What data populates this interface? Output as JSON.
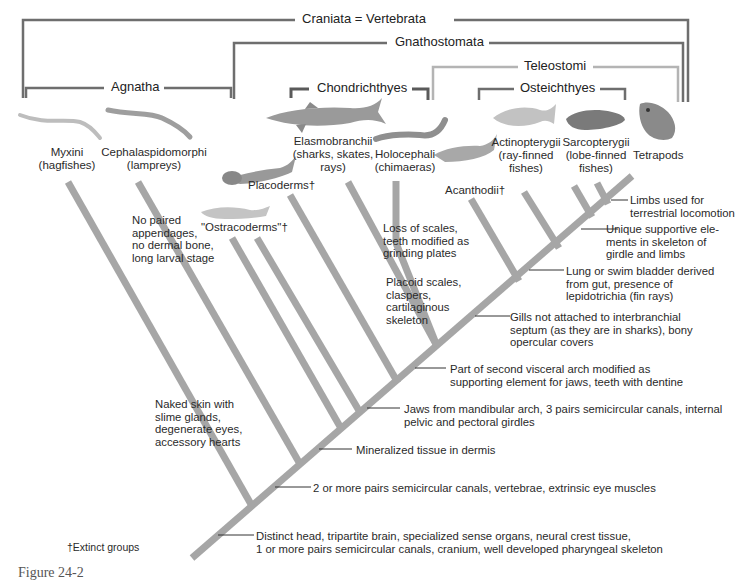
{
  "clades": {
    "craniata": "Craniata = Vertebrata",
    "gnathostomata": "Gnathostomata",
    "teleostomi": "Teleostomi",
    "agnatha": "Agnatha",
    "chondrichthyes": "Chondrichthyes",
    "osteichthyes": "Osteichthyes"
  },
  "taxa": {
    "myxini": "Myxini\n(hagfishes)",
    "cephalaspidomorphi": "Cephalaspidomorphi\n(lampreys)",
    "ostracoderms": "\"Ostracoderms\"†",
    "placoderms": "Placoderms†",
    "elasmobranchii": "Elasmobranchii\n(sharks, skates,\nrays)",
    "holocephali": "Holocephali\n(chimaeras)",
    "acanthodii": "Acanthodii†",
    "actinopterygii": "Actinopterygii\n(ray-finned\nfishes)",
    "sarcopterygii": "Sarcopterygii\n(lobe-finned\nfishes)",
    "tetrapods": "Tetrapods"
  },
  "traits": {
    "hagfish": "Naked skin with\nslime glands,\ndegenerate eyes,\naccessory hearts",
    "lamprey": "No paired\nappendages,\nno dermal bone,\nlong larval stage",
    "holocephali": "Loss of scales,\nteeth modified as\ngrinding plates",
    "chondrichthyes": "Placoid scales,\nclaspers,\ncartilaginous\nskeleton",
    "tetrapods": "Limbs used for\nterrestrial locomotion",
    "sarcopterygii": "Unique supportive ele-\nments in skeleton of\ngirdle and limbs",
    "osteichthyes": "Lung or swim bladder derived\nfrom gut, presence of\nlepidotrichia (fin rays)",
    "teleostomi": "Gills not attached to interbranchial\nseptum (as they are in sharks), bony\nopercular covers",
    "second_arch": "Part of second visceral arch modified as\nsupporting element for jaws, teeth with dentine",
    "gnathostomata": "Jaws from mandibular arch, 3 pairs semicircular canals, internal\npelvic and pectoral girdles",
    "mineralized": "Mineralized tissue in dermis",
    "vertebrae": "2 or more pairs semicircular canals, vertebrae, extrinsic eye muscles",
    "craniata": "Distinct head, tripartite brain, specialized sense organs, neural crest tissue,\n1 or more pairs semicircular canals, cranium, well developed pharyngeal skeleton"
  },
  "footnote": "†Extinct groups",
  "caption": "Figure 24-2",
  "colors": {
    "branch": "#a6a6a6",
    "bracket_dark": "#6e6e6e",
    "bracket_light": "#b4b4b4",
    "text": "#2a2a2a"
  }
}
